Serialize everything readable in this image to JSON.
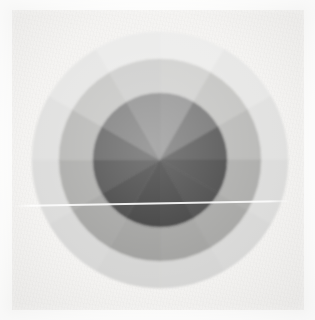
{
  "figure": {
    "background_color": "#f4f3f1",
    "canvas_color": "#fdfdfc",
    "artifact_label": "horizontal scratch line"
  },
  "chart_data": {
    "type": "pie",
    "subtitle": "",
    "xlabel": "",
    "ylabel": "",
    "grid": false,
    "legend_position": "none",
    "center_x": 160,
    "center_y": 160,
    "sector_count": 12,
    "sector_angle_degrees": 30,
    "start_angle_degrees": -90,
    "ring_count": 3,
    "ring_radii": [
      67,
      101,
      128
    ],
    "rings": [
      {
        "name": "inner",
        "inner_radius": 0,
        "outer_radius": 67,
        "values": [
          30,
          30,
          30,
          30,
          30,
          30,
          30,
          30,
          30,
          30,
          30,
          30
        ],
        "colors": [
          "#8f8f8f",
          "#6e6e6e",
          "#4c4c4c",
          "#3d3d3d",
          "#3a3a3a",
          "#333333",
          "#2f2f2f",
          "#353535",
          "#454545",
          "#5a5a5a",
          "#777777",
          "#8a8a8a"
        ]
      },
      {
        "name": "middle",
        "inner_radius": 67,
        "outer_radius": 101,
        "values": [
          30,
          30,
          30,
          30,
          30,
          30,
          30,
          30,
          30,
          30,
          30,
          30
        ],
        "colors": [
          "#cfcfcd",
          "#c2c2c0",
          "#b6b6b4",
          "#a9a9a7",
          "#a2a2a0",
          "#9d9d9b",
          "#9a9a98",
          "#9f9f9d",
          "#a8a8a6",
          "#b5b5b3",
          "#c4c4c2",
          "#cccccb"
        ]
      },
      {
        "name": "outer",
        "inner_radius": 101,
        "outer_radius": 128,
        "values": [
          30,
          30,
          30,
          30,
          30,
          30,
          30,
          30,
          30,
          30,
          30,
          30
        ],
        "colors": [
          "#ececeb",
          "#e6e6e5",
          "#e0e0df",
          "#dbdbda",
          "#d7d7d6",
          "#d4d4d3",
          "#d3d3d2",
          "#d6d6d5",
          "#dadad9",
          "#dfdfde",
          "#e5e5e4",
          "#eaeae9"
        ]
      }
    ]
  }
}
